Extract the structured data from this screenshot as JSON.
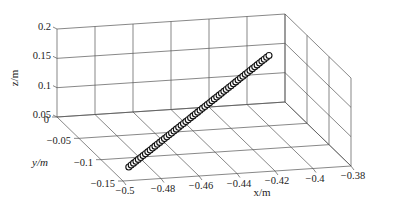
{
  "chart_data": {
    "type": "scatter3d",
    "title": "",
    "xlabel": "x/m",
    "ylabel": "y/m",
    "zlabel": "z/m",
    "xlim": [
      -0.5,
      -0.38
    ],
    "ylim": [
      -0.15,
      0
    ],
    "zlim": [
      0.05,
      0.2
    ],
    "x_ticks": [
      "-0.5",
      "-0.48",
      "-0.46",
      "-0.44",
      "-0.42",
      "-0.4",
      "-0.38"
    ],
    "y_ticks": [
      "0",
      "-0.05",
      "-0.1",
      "-0.15"
    ],
    "z_ticks": [
      "0.05",
      "0.1",
      "0.15",
      "0.2"
    ],
    "grid": true,
    "marker": "open-circle",
    "series": [
      {
        "name": "trajectory",
        "description": "Straight-line trajectory of ~60 points from about (-0.49, -0.12, 0.05) to (-0.40, -0.05, 0.17)",
        "start": {
          "x": -0.49,
          "y": -0.12,
          "z": 0.05
        },
        "end": {
          "x": -0.4,
          "y": -0.05,
          "z": 0.17
        },
        "points": 60
      }
    ]
  }
}
